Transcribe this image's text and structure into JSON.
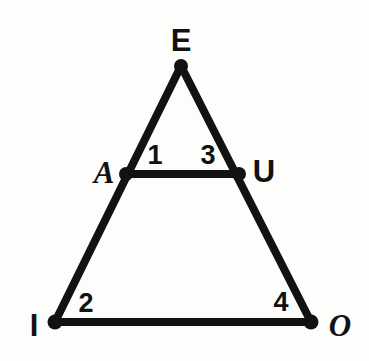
{
  "figure": {
    "type": "geometry-diagram",
    "background_color": "#fdfdfc",
    "stroke_color": "#121212",
    "stroke_width": 8,
    "canvas": {
      "width": 369,
      "height": 361
    }
  },
  "vertices": [
    {
      "id": "E",
      "label": "E",
      "x": 181,
      "y": 66,
      "label_x": 181,
      "label_y": 40,
      "style": "upright"
    },
    {
      "id": "A",
      "label": "A",
      "x": 126,
      "y": 174,
      "label_x": 104,
      "label_y": 172,
      "style": "italic"
    },
    {
      "id": "U",
      "label": "U",
      "x": 239,
      "y": 174,
      "label_x": 264,
      "label_y": 171,
      "style": "upright"
    },
    {
      "id": "I",
      "label": "I",
      "x": 55,
      "y": 322,
      "label_x": 34,
      "label_y": 325,
      "style": "upright"
    },
    {
      "id": "O",
      "label": "O",
      "x": 311,
      "y": 322,
      "label_x": 340,
      "label_y": 325,
      "style": "italic"
    }
  ],
  "edges": [
    {
      "id": "E-I",
      "from": "E",
      "to": "I"
    },
    {
      "id": "E-O",
      "from": "E",
      "to": "O"
    },
    {
      "id": "A-U",
      "from": "A",
      "to": "U"
    },
    {
      "id": "I-O",
      "from": "I",
      "to": "O"
    }
  ],
  "angle_labels": [
    {
      "id": "angle-1",
      "label": "1",
      "x": 155,
      "y": 155,
      "at_vertex": "A"
    },
    {
      "id": "angle-2",
      "label": "2",
      "x": 86,
      "y": 303,
      "at_vertex": "I"
    },
    {
      "id": "angle-3",
      "label": "3",
      "x": 208,
      "y": 155,
      "at_vertex": "U"
    },
    {
      "id": "angle-4",
      "label": "4",
      "x": 281,
      "y": 302,
      "at_vertex": "O"
    }
  ]
}
